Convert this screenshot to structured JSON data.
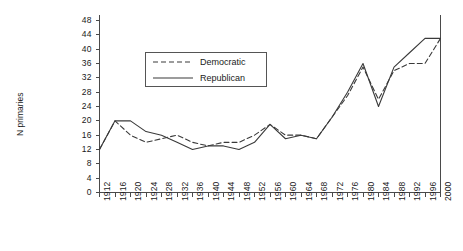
{
  "chart_data": {
    "type": "line",
    "title": "",
    "xlabel": "",
    "ylabel": "N primaries",
    "xlim": [
      1912,
      2000
    ],
    "ylim": [
      0,
      50
    ],
    "yticks": [
      0,
      4,
      8,
      12,
      16,
      20,
      24,
      28,
      32,
      36,
      40,
      44,
      48
    ],
    "grid": false,
    "legend_position": "upper center",
    "x": [
      1912,
      1916,
      1920,
      1924,
      1928,
      1932,
      1936,
      1940,
      1944,
      1948,
      1952,
      1956,
      1960,
      1964,
      1968,
      1972,
      1976,
      1980,
      1984,
      1988,
      1992,
      1996,
      2000
    ],
    "categories": [
      "1912",
      "1916",
      "1920",
      "1924",
      "1928",
      "1932",
      "1936",
      "1940",
      "1944",
      "1948",
      "1952",
      "1956",
      "1960",
      "1964",
      "1968",
      "1972",
      "1976",
      "1980",
      "1984",
      "1988",
      "1992",
      "1996",
      "2000"
    ],
    "series": [
      {
        "name": "Democratic",
        "style": "dashed",
        "color": "#3a3a3a",
        "values": [
          12,
          20,
          16,
          14,
          15,
          16,
          14,
          13,
          14,
          14,
          16,
          19,
          16,
          16,
          15,
          21,
          27,
          35,
          26,
          34,
          36,
          36,
          43
        ]
      },
      {
        "name": "Republican",
        "style": "solid",
        "color": "#3a3a3a",
        "values": [
          12,
          20,
          20,
          17,
          16,
          14,
          12,
          13,
          13,
          12,
          14,
          19,
          15,
          16,
          15,
          21,
          28,
          36,
          24,
          35,
          39,
          43,
          43
        ]
      }
    ]
  },
  "legend": {
    "items": [
      {
        "label": "Democratic",
        "style": "dashed"
      },
      {
        "label": "Republican",
        "style": "solid"
      }
    ]
  },
  "axes": {
    "y_label": "N primaries"
  }
}
